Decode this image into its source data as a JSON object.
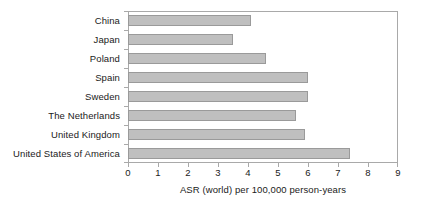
{
  "chart_data": {
    "type": "bar",
    "orientation": "horizontal",
    "title": "",
    "xlabel": "ASR (world) per 100,000 person-years",
    "ylabel": "",
    "xlim": [
      0,
      9
    ],
    "xticks": [
      0,
      1,
      2,
      3,
      4,
      5,
      6,
      7,
      8,
      9
    ],
    "xtick_labels": [
      "0",
      "1",
      "2",
      "3",
      "4",
      "5",
      "6",
      "7",
      "8",
      "9"
    ],
    "grid": false,
    "legend": null,
    "categories": [
      "China",
      "Japan",
      "Poland",
      "Spain",
      "Sweden",
      "The Netherlands",
      "United Kingdom",
      "United States of America"
    ],
    "values": [
      4.1,
      3.5,
      4.6,
      6.0,
      6.0,
      5.6,
      5.9,
      7.4
    ],
    "series": [
      {
        "name": "ASR (world) per 100,000 person-years",
        "values": [
          4.1,
          3.5,
          4.6,
          6.0,
          6.0,
          5.6,
          5.9,
          7.4
        ]
      }
    ],
    "colors": {
      "bar_fill": "#bfbfbf",
      "bar_border": "#9a9a9a",
      "axis": "#a9a9a9",
      "text": "#1a1a1a",
      "background": "#ffffff"
    }
  }
}
